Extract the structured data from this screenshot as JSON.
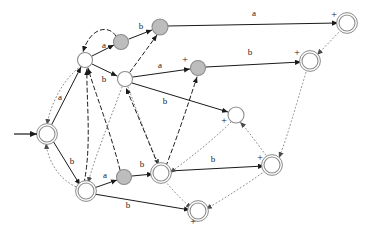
{
  "figure": {
    "kind": "finite-state-automaton-diagram",
    "width": 374,
    "height": 233,
    "background_color": "#ffffff",
    "colors": {
      "node_stroke": "#8c8c8c",
      "node_fill_white": "#ffffff",
      "node_fill_gray": "#bdbdbd",
      "solid_edge": "#1a1a1a",
      "dashed_edge": "#1a1a1a",
      "dotted_edge": "#8c8c8c",
      "label_text": "#1a1a1a"
    },
    "alphabet": [
      "a",
      "b"
    ],
    "start_arrow": {
      "name": "start-arrow",
      "from_x": 14,
      "from_y": 134,
      "to_x": 37,
      "to_y": 134
    }
  },
  "nodes": [
    {
      "id": "n0",
      "name": "state-start",
      "cx": 47,
      "cy": 134,
      "r": 8,
      "fill": "white",
      "double": true,
      "plus": false,
      "plus_dx": 0,
      "plus_dy": 0
    },
    {
      "id": "n1",
      "name": "state-upper-left",
      "cx": 85,
      "cy": 60,
      "r": 7.5,
      "fill": "white",
      "double": false,
      "plus": false,
      "plus_dx": 0,
      "plus_dy": 0
    },
    {
      "id": "n2",
      "name": "state-gray-top-a",
      "cx": 121,
      "cy": 42,
      "r": 7.5,
      "fill": "gray",
      "double": false,
      "plus": false,
      "plus_dx": 0,
      "plus_dy": 0
    },
    {
      "id": "n3",
      "name": "state-gray-top-b",
      "cx": 160,
      "cy": 27,
      "r": 8,
      "fill": "gray",
      "double": false,
      "plus": false,
      "plus_dx": 0,
      "plus_dy": 0
    },
    {
      "id": "n4",
      "name": "state-center-upper",
      "cx": 125,
      "cy": 79,
      "r": 7.5,
      "fill": "white",
      "double": false,
      "plus": false,
      "plus_dx": 0,
      "plus_dy": 0
    },
    {
      "id": "n5",
      "name": "state-gray-mid",
      "cx": 198,
      "cy": 68,
      "r": 7.5,
      "fill": "gray",
      "double": false,
      "plus": true,
      "plus_dx": -13,
      "plus_dy": -5
    },
    {
      "id": "n6",
      "name": "state-accept-top",
      "cx": 347,
      "cy": 23,
      "r": 8,
      "fill": "white",
      "double": true,
      "plus": true,
      "plus_dx": -13,
      "plus_dy": -5
    },
    {
      "id": "n7",
      "name": "state-accept-upper",
      "cx": 310,
      "cy": 61,
      "r": 8,
      "fill": "white",
      "double": true,
      "plus": true,
      "plus_dx": -13,
      "plus_dy": -5
    },
    {
      "id": "n8",
      "name": "state-center-right",
      "cx": 236,
      "cy": 115,
      "r": 8,
      "fill": "white",
      "double": false,
      "plus": true,
      "plus_dx": -12,
      "plus_dy": 9
    },
    {
      "id": "n9",
      "name": "state-accept-right",
      "cx": 272,
      "cy": 165,
      "r": 8,
      "fill": "white",
      "double": true,
      "plus": true,
      "plus_dx": -12,
      "plus_dy": -4
    },
    {
      "id": "n10",
      "name": "state-lower-left",
      "cx": 86,
      "cy": 191,
      "r": 8,
      "fill": "white",
      "double": true,
      "plus": false,
      "plus_dx": 0,
      "plus_dy": 0
    },
    {
      "id": "n11",
      "name": "state-gray-lower",
      "cx": 124,
      "cy": 177,
      "r": 7.5,
      "fill": "gray",
      "double": false,
      "plus": false,
      "plus_dx": 0,
      "plus_dy": 0
    },
    {
      "id": "n12",
      "name": "state-center-lower",
      "cx": 161,
      "cy": 173,
      "r": 8,
      "fill": "white",
      "double": true,
      "plus": false,
      "plus_dx": 0,
      "plus_dy": 0
    },
    {
      "id": "n13",
      "name": "state-accept-bottom",
      "cx": 198,
      "cy": 211,
      "r": 8,
      "fill": "white",
      "double": true,
      "plus": true,
      "plus_dx": -5,
      "plus_dy": 14
    }
  ],
  "edges": [
    {
      "name": "edge-n1-n2-a",
      "from": "n1",
      "to": "n2",
      "style": "solid",
      "label": "a",
      "label_x": 104,
      "label_y": 48,
      "path": "M 92 56 L 114 45"
    },
    {
      "name": "edge-n2-n1-back",
      "from": "n2",
      "to": "n1",
      "style": "dashed",
      "label": "",
      "label_x": 0,
      "label_y": 0,
      "path": "M 116 36 C 108 24 90 28 83 52"
    },
    {
      "name": "edge-n2-n3-b",
      "from": "n2",
      "to": "n3",
      "style": "solid",
      "label": "b",
      "label_x": 141,
      "label_y": 29,
      "path": "M 129 39 L 152 30"
    },
    {
      "name": "edge-n3-n6-a",
      "from": "n3",
      "to": "n6",
      "style": "solid",
      "label": "a",
      "label_x": 254,
      "label_y": 16,
      "path": "M 168 26 L 338 23"
    },
    {
      "name": "edge-n4-n3-dash",
      "from": "n4",
      "to": "n3",
      "style": "dashed",
      "label": "",
      "label_x": 0,
      "label_y": 0,
      "path": "M 130 72 L 157 35"
    },
    {
      "name": "edge-n1-n4-b",
      "from": "n1",
      "to": "n4",
      "style": "solid",
      "label": "b",
      "label_x": 104,
      "label_y": 82,
      "path": "M 92 64 L 117 76"
    },
    {
      "name": "edge-n4-n5-a",
      "from": "n4",
      "to": "n5",
      "style": "solid",
      "label": "a",
      "label_x": 160,
      "label_y": 68,
      "path": "M 133 77 L 190 69"
    },
    {
      "name": "edge-n5-n7-b",
      "from": "n5",
      "to": "n7",
      "style": "solid",
      "label": "b",
      "label_x": 250,
      "label_y": 55,
      "path": "M 206 67 L 301 62"
    },
    {
      "name": "edge-n4-n8-b",
      "from": "n4",
      "to": "n8",
      "style": "solid",
      "label": "b",
      "label_x": 165,
      "label_y": 104,
      "path": "M 132 83 L 228 112"
    },
    {
      "name": "edge-n6-n7-dot",
      "from": "n6",
      "to": "n7",
      "style": "dotted",
      "label": "",
      "label_x": 0,
      "label_y": 0,
      "path": "M 341 30 L 317 55"
    },
    {
      "name": "edge-n7-n9-dot",
      "from": "n7",
      "to": "n9",
      "style": "dotted",
      "label": "",
      "label_x": 0,
      "label_y": 0,
      "path": "M 307 69 C 296 105 288 135 279 158"
    },
    {
      "name": "edge-n0-n1-dot",
      "from": "n0",
      "to": "n1",
      "style": "dotted",
      "label": "a",
      "label_x": 60,
      "label_y": 100,
      "path": "M 81 66 C 62 80 50 106 47 125"
    },
    {
      "name": "edge-n0-n1-sol",
      "from": "n0",
      "to": "n1",
      "style": "solid",
      "label": "",
      "label_x": 0,
      "label_y": 0,
      "path": "M 51 126 L 81 67"
    },
    {
      "name": "edge-n0-n10-b",
      "from": "n0",
      "to": "n10",
      "style": "solid",
      "label": "b",
      "label_x": 72,
      "label_y": 164,
      "path": "M 53 141 L 80 185"
    },
    {
      "name": "edge-n10-n0-dot",
      "from": "n10",
      "to": "n0",
      "style": "dotted",
      "label": "",
      "label_x": 0,
      "label_y": 0,
      "path": "M 79 188 C 58 180 48 160 46 143"
    },
    {
      "name": "edge-n10-n11-a",
      "from": "n10",
      "to": "n11",
      "style": "solid",
      "label": "a",
      "label_x": 105,
      "label_y": 178,
      "path": "M 94 188 L 117 180"
    },
    {
      "name": "edge-n11-n12-b",
      "from": "n11",
      "to": "n12",
      "style": "solid",
      "label": "b",
      "label_x": 142,
      "label_y": 167,
      "path": "M 132 176 L 153 174"
    },
    {
      "name": "edge-n12-n9-b",
      "from": "n12",
      "to": "n9",
      "style": "solid",
      "label": "b",
      "label_x": 213,
      "label_y": 162,
      "path": "M 169 171 L 264 166"
    },
    {
      "name": "edge-n10-n13-b",
      "from": "n10",
      "to": "n13",
      "style": "solid",
      "label": "b",
      "label_x": 128,
      "label_y": 208,
      "path": "M 94 194 L 190 210"
    },
    {
      "name": "edge-n4-n10-dot",
      "from": "n4",
      "to": "n10",
      "style": "dotted",
      "label": "",
      "label_x": 0,
      "label_y": 0,
      "path": "M 122 87 C 108 125 94 160 88 183"
    },
    {
      "name": "edge-n4-n12-dot",
      "from": "n4",
      "to": "n12",
      "style": "dotted",
      "label": "",
      "label_x": 0,
      "label_y": 0,
      "path": "M 128 87 C 140 120 152 150 159 165"
    },
    {
      "name": "edge-n10-n1-dash",
      "from": "n10",
      "to": "n1",
      "style": "dashed",
      "label": "",
      "label_x": 0,
      "label_y": 0,
      "path": "M 84 183 C 92 145 86 95 87 69"
    },
    {
      "name": "edge-n11-n1-dash",
      "from": "n11",
      "to": "n1",
      "style": "dashed",
      "label": "",
      "label_x": 0,
      "label_y": 0,
      "path": "M 120 170 C 110 130 94 90 88 68"
    },
    {
      "name": "edge-n12-n4-dash",
      "from": "n12",
      "to": "n4",
      "style": "dashed",
      "label": "",
      "label_x": 0,
      "label_y": 0,
      "path": "M 158 165 C 146 135 132 102 126 88"
    },
    {
      "name": "edge-n12-n5-dash",
      "from": "n12",
      "to": "n5",
      "style": "dashed",
      "label": "",
      "label_x": 0,
      "label_y": 0,
      "path": "M 166 166 C 180 130 192 92 197 77"
    },
    {
      "name": "edge-n8-n12-dot",
      "from": "n8",
      "to": "n12",
      "style": "dotted",
      "label": "",
      "label_x": 0,
      "label_y": 0,
      "path": "M 231 122 C 208 145 180 165 170 173"
    },
    {
      "name": "edge-n9-n8-dot",
      "from": "n9",
      "to": "n8",
      "style": "dotted",
      "label": "",
      "label_x": 0,
      "label_y": 0,
      "path": "M 268 158 C 256 142 246 128 240 122"
    },
    {
      "name": "edge-n12-n13-dot",
      "from": "n12",
      "to": "n13",
      "style": "dotted",
      "label": "",
      "label_x": 0,
      "label_y": 0,
      "path": "M 165 181 C 176 194 186 204 192 208"
    },
    {
      "name": "edge-n9-n13-dot",
      "from": "n9",
      "to": "n13",
      "style": "dotted",
      "label": "",
      "label_x": 0,
      "label_y": 0,
      "path": "M 265 171 C 240 189 215 204 206 209"
    }
  ]
}
